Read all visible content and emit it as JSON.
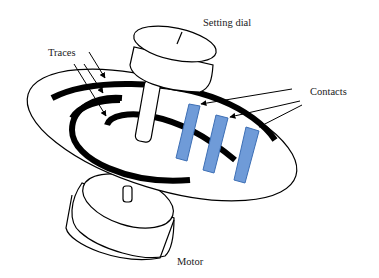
{
  "diagram": {
    "type": "mechanical-schematic",
    "labels": {
      "setting_dial": "Setting dial",
      "traces": "Traces",
      "contacts": "Contacts",
      "motor": "Motor"
    },
    "colors": {
      "outline": "#000000",
      "trace": "#000000",
      "contact_fill": "#6f9bd8",
      "contact_stroke": "#3d6fb5",
      "background": "#ffffff"
    },
    "components": [
      {
        "id": "setting-dial",
        "shape": "cylinder"
      },
      {
        "id": "disc",
        "shape": "ellipse"
      },
      {
        "id": "traces",
        "count": 3
      },
      {
        "id": "contacts",
        "count": 3
      },
      {
        "id": "motor",
        "shape": "cylinder"
      }
    ]
  }
}
